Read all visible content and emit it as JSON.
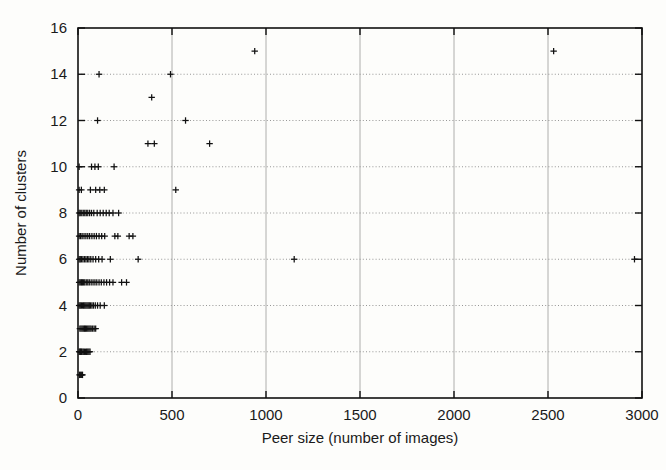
{
  "chart_data": {
    "type": "scatter",
    "title": "",
    "xlabel": "Peer size (number of images)",
    "ylabel": "Number of clusters",
    "xlim": [
      0,
      3000
    ],
    "ylim": [
      0,
      16
    ],
    "xticks": [
      0,
      500,
      1000,
      1500,
      2000,
      2500,
      3000
    ],
    "yticks": [
      0,
      2,
      4,
      6,
      8,
      10,
      12,
      14,
      16
    ],
    "xtick_labels": [
      "0",
      "500",
      "1000",
      "1500",
      "2000",
      "2500",
      "3000"
    ],
    "ytick_labels": [
      "0",
      "2",
      "4",
      "6",
      "8",
      "10",
      "12",
      "14",
      "16"
    ],
    "grid": "horizontal dotted at y ticks, vertical solid-light at x ticks",
    "legend": null,
    "marker": "plus",
    "marker_color": "#111111",
    "series": [
      {
        "name": "peers",
        "points": [
          [
            8,
            1
          ],
          [
            12,
            1
          ],
          [
            16,
            1
          ],
          [
            20,
            1
          ],
          [
            24,
            1
          ],
          [
            6,
            2
          ],
          [
            10,
            2
          ],
          [
            14,
            2
          ],
          [
            18,
            2
          ],
          [
            22,
            2
          ],
          [
            28,
            2
          ],
          [
            34,
            2
          ],
          [
            40,
            2
          ],
          [
            46,
            2
          ],
          [
            52,
            2
          ],
          [
            58,
            2
          ],
          [
            64,
            2
          ],
          [
            10,
            3
          ],
          [
            16,
            3
          ],
          [
            22,
            3
          ],
          [
            28,
            3
          ],
          [
            34,
            3
          ],
          [
            40,
            3
          ],
          [
            46,
            3
          ],
          [
            52,
            3
          ],
          [
            58,
            3
          ],
          [
            64,
            3
          ],
          [
            70,
            3
          ],
          [
            78,
            3
          ],
          [
            86,
            3
          ],
          [
            94,
            3
          ],
          [
            6,
            4
          ],
          [
            12,
            4
          ],
          [
            18,
            4
          ],
          [
            24,
            4
          ],
          [
            30,
            4
          ],
          [
            36,
            4
          ],
          [
            42,
            4
          ],
          [
            48,
            4
          ],
          [
            54,
            4
          ],
          [
            60,
            4
          ],
          [
            66,
            4
          ],
          [
            74,
            4
          ],
          [
            82,
            4
          ],
          [
            92,
            4
          ],
          [
            104,
            4
          ],
          [
            118,
            4
          ],
          [
            140,
            4
          ],
          [
            6,
            5
          ],
          [
            12,
            5
          ],
          [
            18,
            5
          ],
          [
            24,
            5
          ],
          [
            30,
            5
          ],
          [
            36,
            5
          ],
          [
            44,
            5
          ],
          [
            52,
            5
          ],
          [
            60,
            5
          ],
          [
            70,
            5
          ],
          [
            80,
            5
          ],
          [
            90,
            5
          ],
          [
            100,
            5
          ],
          [
            112,
            5
          ],
          [
            124,
            5
          ],
          [
            138,
            5
          ],
          [
            152,
            5
          ],
          [
            168,
            5
          ],
          [
            186,
            5
          ],
          [
            232,
            5
          ],
          [
            258,
            5
          ],
          [
            6,
            6
          ],
          [
            12,
            6
          ],
          [
            18,
            6
          ],
          [
            26,
            6
          ],
          [
            34,
            6
          ],
          [
            42,
            6
          ],
          [
            50,
            6
          ],
          [
            58,
            6
          ],
          [
            68,
            6
          ],
          [
            80,
            6
          ],
          [
            94,
            6
          ],
          [
            110,
            6
          ],
          [
            128,
            6
          ],
          [
            172,
            6
          ],
          [
            320,
            6
          ],
          [
            1150,
            6
          ],
          [
            2960,
            6
          ],
          [
            6,
            7
          ],
          [
            14,
            7
          ],
          [
            22,
            7
          ],
          [
            32,
            7
          ],
          [
            42,
            7
          ],
          [
            52,
            7
          ],
          [
            62,
            7
          ],
          [
            74,
            7
          ],
          [
            86,
            7
          ],
          [
            98,
            7
          ],
          [
            112,
            7
          ],
          [
            126,
            7
          ],
          [
            142,
            7
          ],
          [
            196,
            7
          ],
          [
            212,
            7
          ],
          [
            272,
            7
          ],
          [
            292,
            7
          ],
          [
            6,
            8
          ],
          [
            12,
            8
          ],
          [
            20,
            8
          ],
          [
            28,
            8
          ],
          [
            36,
            8
          ],
          [
            44,
            8
          ],
          [
            52,
            8
          ],
          [
            62,
            8
          ],
          [
            72,
            8
          ],
          [
            84,
            8
          ],
          [
            102,
            8
          ],
          [
            118,
            8
          ],
          [
            134,
            8
          ],
          [
            150,
            8
          ],
          [
            166,
            8
          ],
          [
            186,
            8
          ],
          [
            216,
            8
          ],
          [
            6,
            9
          ],
          [
            18,
            9
          ],
          [
            66,
            9
          ],
          [
            94,
            9
          ],
          [
            116,
            9
          ],
          [
            140,
            9
          ],
          [
            520,
            9
          ],
          [
            6,
            10
          ],
          [
            72,
            10
          ],
          [
            90,
            10
          ],
          [
            108,
            10
          ],
          [
            192,
            10
          ],
          [
            372,
            11
          ],
          [
            406,
            11
          ],
          [
            700,
            11
          ],
          [
            104,
            12
          ],
          [
            572,
            12
          ],
          [
            392,
            13
          ],
          [
            112,
            14
          ],
          [
            492,
            14
          ],
          [
            940,
            15
          ],
          [
            2530,
            15
          ]
        ]
      }
    ]
  },
  "figure": {
    "background_color": "#fdfdfb",
    "axis_color": "#111111",
    "grid_color": "#8a8a8a"
  }
}
